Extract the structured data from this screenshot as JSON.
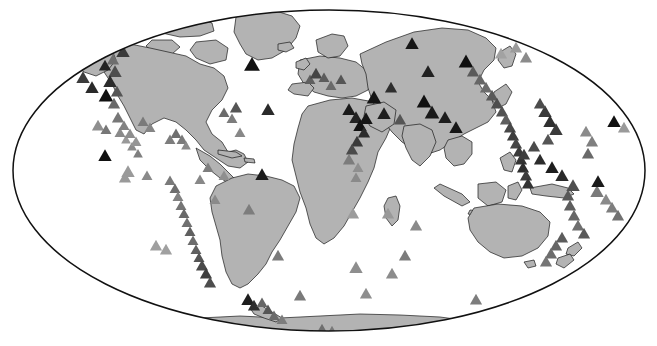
{
  "figure": {
    "title": "",
    "caption": "",
    "width": 657,
    "height": 346,
    "background_color": "#ffffff"
  },
  "chart_data": {
    "type": "scatter",
    "title": "",
    "subtitle": "",
    "xlabel": "",
    "ylabel": "",
    "projection": "mollweide",
    "grid": false,
    "legend": null,
    "annotations": [],
    "xlim": [
      -180,
      180
    ],
    "ylim": [
      -90,
      90
    ],
    "map_style": {
      "land_fill": "#b3b3b3",
      "land_stroke": "#1a1a1a",
      "ocean_fill": "#ffffff",
      "outline_stroke": "#111111",
      "outline_width": 1.4
    },
    "marker": {
      "shape": "triangle",
      "sizes_px": [
        6,
        9,
        12,
        15
      ],
      "shades": [
        "#111111",
        "#4d4d4d",
        "#6e6e6e",
        "#8f8f8f",
        "#aaaaaa"
      ]
    },
    "series": [
      {
        "name": "markers",
        "marker": "triangle",
        "points": [
          {
            "x": 30,
            "y": 24,
            "s": 11,
            "c": "#6e6e6e"
          },
          {
            "x": 44,
            "y": 22,
            "s": 9,
            "c": "#8f8f8f"
          },
          {
            "x": 53,
            "y": 26,
            "s": 9,
            "c": "#6e6e6e"
          },
          {
            "x": 62,
            "y": 23,
            "s": 10,
            "c": "#555555"
          },
          {
            "x": 71,
            "y": 25,
            "s": 9,
            "c": "#7a7a7a"
          },
          {
            "x": 80,
            "y": 27,
            "s": 9,
            "c": "#8f8f8f"
          },
          {
            "x": 88,
            "y": 30,
            "s": 9,
            "c": "#666666"
          },
          {
            "x": 96,
            "y": 34,
            "s": 10,
            "c": "#5a5a5a"
          },
          {
            "x": 104,
            "y": 40,
            "s": 11,
            "c": "#333333"
          },
          {
            "x": 111,
            "y": 46,
            "s": 11,
            "c": "#444444"
          },
          {
            "x": 118,
            "y": 43,
            "s": 12,
            "c": "#1f1f1f"
          },
          {
            "x": 123,
            "y": 52,
            "s": 11,
            "c": "#3a3a3a"
          },
          {
            "x": 113,
            "y": 60,
            "s": 10,
            "c": "#6e6e6e"
          },
          {
            "x": 105,
            "y": 66,
            "s": 10,
            "c": "#222222"
          },
          {
            "x": 115,
            "y": 72,
            "s": 11,
            "c": "#4d4d4d"
          },
          {
            "x": 110,
            "y": 82,
            "s": 11,
            "c": "#2b2b2b"
          },
          {
            "x": 117,
            "y": 92,
            "s": 10,
            "c": "#555555"
          },
          {
            "x": 106,
            "y": 96,
            "s": 12,
            "c": "#111111"
          },
          {
            "x": 114,
            "y": 104,
            "s": 10,
            "c": "#6a6a6a"
          },
          {
            "x": 98,
            "y": 126,
            "s": 10,
            "c": "#8f8f8f"
          },
          {
            "x": 106,
            "y": 130,
            "s": 9,
            "c": "#777777"
          },
          {
            "x": 105,
            "y": 156,
            "s": 11,
            "c": "#111111"
          },
          {
            "x": 128,
            "y": 172,
            "s": 11,
            "c": "#9a9a9a"
          },
          {
            "x": 120,
            "y": 133,
            "s": 9,
            "c": "#8a8a8a"
          },
          {
            "x": 126,
            "y": 140,
            "s": 8,
            "c": "#999999"
          },
          {
            "x": 132,
            "y": 147,
            "s": 8,
            "c": "#8c8c8c"
          },
          {
            "x": 138,
            "y": 154,
            "s": 8,
            "c": "#7f7f7f"
          },
          {
            "x": 143,
            "y": 122,
            "s": 9,
            "c": "#7a7a7a"
          },
          {
            "x": 150,
            "y": 128,
            "s": 9,
            "c": "#858585"
          },
          {
            "x": 176,
            "y": 134,
            "s": 9,
            "c": "#6f6f6f"
          },
          {
            "x": 182,
            "y": 140,
            "s": 9,
            "c": "#7b7b7b"
          },
          {
            "x": 186,
            "y": 146,
            "s": 8,
            "c": "#8b8b8b"
          },
          {
            "x": 170,
            "y": 181,
            "s": 9,
            "c": "#7a7a7a"
          },
          {
            "x": 175,
            "y": 189,
            "s": 9,
            "c": "#6e6e6e"
          },
          {
            "x": 178,
            "y": 197,
            "s": 9,
            "c": "#828282"
          },
          {
            "x": 181,
            "y": 206,
            "s": 9,
            "c": "#757575"
          },
          {
            "x": 184,
            "y": 214,
            "s": 9,
            "c": "#6a6a6a"
          },
          {
            "x": 187,
            "y": 223,
            "s": 9,
            "c": "#707070"
          },
          {
            "x": 190,
            "y": 232,
            "s": 9,
            "c": "#5f5f5f"
          },
          {
            "x": 193,
            "y": 241,
            "s": 9,
            "c": "#6c6c6c"
          },
          {
            "x": 196,
            "y": 250,
            "s": 9,
            "c": "#606060"
          },
          {
            "x": 199,
            "y": 258,
            "s": 9,
            "c": "#555555"
          },
          {
            "x": 202,
            "y": 266,
            "s": 10,
            "c": "#4a4a4a"
          },
          {
            "x": 206,
            "y": 274,
            "s": 10,
            "c": "#3f3f3f"
          },
          {
            "x": 210,
            "y": 283,
            "s": 10,
            "c": "#4d4d4d"
          },
          {
            "x": 166,
            "y": 250,
            "s": 10,
            "c": "#a0a0a0"
          },
          {
            "x": 125,
            "y": 178,
            "s": 10,
            "c": "#9a9a9a"
          },
          {
            "x": 147,
            "y": 176,
            "s": 9,
            "c": "#8a8a8a"
          },
          {
            "x": 170,
            "y": 140,
            "s": 9,
            "c": "#7d7d7d"
          },
          {
            "x": 224,
            "y": 113,
            "s": 9,
            "c": "#6b6b6b"
          },
          {
            "x": 236,
            "y": 108,
            "s": 10,
            "c": "#555555"
          },
          {
            "x": 232,
            "y": 119,
            "s": 9,
            "c": "#7c7c7c"
          },
          {
            "x": 240,
            "y": 133,
            "s": 9,
            "c": "#888888"
          },
          {
            "x": 252,
            "y": 65,
            "s": 13,
            "c": "#111111"
          },
          {
            "x": 268,
            "y": 110,
            "s": 11,
            "c": "#2a2a2a"
          },
          {
            "x": 262,
            "y": 175,
            "s": 11,
            "c": "#1c1c1c"
          },
          {
            "x": 249,
            "y": 210,
            "s": 10,
            "c": "#7d7d7d"
          },
          {
            "x": 278,
            "y": 256,
            "s": 10,
            "c": "#7b7b7b"
          },
          {
            "x": 310,
            "y": 80,
            "s": 9,
            "c": "#5f5f5f"
          },
          {
            "x": 316,
            "y": 74,
            "s": 10,
            "c": "#444444"
          },
          {
            "x": 324,
            "y": 78,
            "s": 9,
            "c": "#5c5c5c"
          },
          {
            "x": 331,
            "y": 86,
            "s": 9,
            "c": "#6a6a6a"
          },
          {
            "x": 341,
            "y": 80,
            "s": 9,
            "c": "#555555"
          },
          {
            "x": 349,
            "y": 110,
            "s": 11,
            "c": "#1a1a1a"
          },
          {
            "x": 356,
            "y": 118,
            "s": 11,
            "c": "#222222"
          },
          {
            "x": 360,
            "y": 126,
            "s": 11,
            "c": "#111111"
          },
          {
            "x": 364,
            "y": 133,
            "s": 10,
            "c": "#2b2b2b"
          },
          {
            "x": 357,
            "y": 142,
            "s": 10,
            "c": "#3a3a3a"
          },
          {
            "x": 352,
            "y": 150,
            "s": 10,
            "c": "#4a4a4a"
          },
          {
            "x": 349,
            "y": 160,
            "s": 10,
            "c": "#7c7c7c"
          },
          {
            "x": 358,
            "y": 168,
            "s": 9,
            "c": "#8f8f8f"
          },
          {
            "x": 356,
            "y": 178,
            "s": 9,
            "c": "#8a8a8a"
          },
          {
            "x": 353,
            "y": 214,
            "s": 10,
            "c": "#9c9c9c"
          },
          {
            "x": 356,
            "y": 268,
            "s": 11,
            "c": "#8e8e8e"
          },
          {
            "x": 366,
            "y": 119,
            "s": 11,
            "c": "#161616"
          },
          {
            "x": 374,
            "y": 98,
            "s": 12,
            "c": "#141414"
          },
          {
            "x": 384,
            "y": 114,
            "s": 11,
            "c": "#1e1e1e"
          },
          {
            "x": 391,
            "y": 88,
            "s": 10,
            "c": "#2e2e2e"
          },
          {
            "x": 400,
            "y": 120,
            "s": 10,
            "c": "#555555"
          },
          {
            "x": 412,
            "y": 44,
            "s": 11,
            "c": "#171717"
          },
          {
            "x": 424,
            "y": 102,
            "s": 12,
            "c": "#111111"
          },
          {
            "x": 432,
            "y": 113,
            "s": 12,
            "c": "#1a1a1a"
          },
          {
            "x": 428,
            "y": 72,
            "s": 11,
            "c": "#222222"
          },
          {
            "x": 445,
            "y": 118,
            "s": 11,
            "c": "#1d1d1d"
          },
          {
            "x": 456,
            "y": 128,
            "s": 11,
            "c": "#161616"
          },
          {
            "x": 466,
            "y": 62,
            "s": 12,
            "c": "#0f0f0f"
          },
          {
            "x": 473,
            "y": 72,
            "s": 10,
            "c": "#5a5a5a"
          },
          {
            "x": 480,
            "y": 80,
            "s": 10,
            "c": "#666666"
          },
          {
            "x": 486,
            "y": 88,
            "s": 10,
            "c": "#6c6c6c"
          },
          {
            "x": 492,
            "y": 96,
            "s": 10,
            "c": "#595959"
          },
          {
            "x": 497,
            "y": 104,
            "s": 10,
            "c": "#4e4e4e"
          },
          {
            "x": 502,
            "y": 112,
            "s": 10,
            "c": "#525252"
          },
          {
            "x": 506,
            "y": 120,
            "s": 10,
            "c": "#5e5e5e"
          },
          {
            "x": 510,
            "y": 128,
            "s": 10,
            "c": "#484848"
          },
          {
            "x": 513,
            "y": 136,
            "s": 10,
            "c": "#3d3d3d"
          },
          {
            "x": 516,
            "y": 144,
            "s": 10,
            "c": "#464646"
          },
          {
            "x": 519,
            "y": 152,
            "s": 10,
            "c": "#3a3a3a"
          },
          {
            "x": 521,
            "y": 160,
            "s": 10,
            "c": "#333333"
          },
          {
            "x": 523,
            "y": 168,
            "s": 10,
            "c": "#2d2d2d"
          },
          {
            "x": 526,
            "y": 176,
            "s": 10,
            "c": "#3c3c3c"
          },
          {
            "x": 528,
            "y": 184,
            "s": 10,
            "c": "#343434"
          },
          {
            "x": 536,
            "y": 40,
            "s": 11,
            "c": "#777777"
          },
          {
            "x": 546,
            "y": 46,
            "s": 11,
            "c": "#8a8a8a"
          },
          {
            "x": 556,
            "y": 52,
            "s": 10,
            "c": "#999999"
          },
          {
            "x": 526,
            "y": 58,
            "s": 10,
            "c": "#8b8b8b"
          },
          {
            "x": 516,
            "y": 48,
            "s": 10,
            "c": "#9b9b9b"
          },
          {
            "x": 501,
            "y": 54,
            "s": 10,
            "c": "#a2a2a2"
          },
          {
            "x": 545,
            "y": 112,
            "s": 11,
            "c": "#3a3a3a"
          },
          {
            "x": 540,
            "y": 104,
            "s": 10,
            "c": "#4c4c4c"
          },
          {
            "x": 550,
            "y": 122,
            "s": 11,
            "c": "#2f2f2f"
          },
          {
            "x": 556,
            "y": 130,
            "s": 11,
            "c": "#3b3b3b"
          },
          {
            "x": 548,
            "y": 140,
            "s": 10,
            "c": "#555555"
          },
          {
            "x": 534,
            "y": 147,
            "s": 10,
            "c": "#4b4b4b"
          },
          {
            "x": 524,
            "y": 155,
            "s": 10,
            "c": "#3e3e3e"
          },
          {
            "x": 540,
            "y": 160,
            "s": 10,
            "c": "#2c2c2c"
          },
          {
            "x": 552,
            "y": 168,
            "s": 11,
            "c": "#1d1d1d"
          },
          {
            "x": 562,
            "y": 176,
            "s": 11,
            "c": "#2a2a2a"
          },
          {
            "x": 573,
            "y": 186,
            "s": 11,
            "c": "#4f4f4f"
          },
          {
            "x": 568,
            "y": 196,
            "s": 10,
            "c": "#585858"
          },
          {
            "x": 570,
            "y": 206,
            "s": 10,
            "c": "#5e5e5e"
          },
          {
            "x": 574,
            "y": 216,
            "s": 10,
            "c": "#676767"
          },
          {
            "x": 578,
            "y": 226,
            "s": 10,
            "c": "#6e6e6e"
          },
          {
            "x": 584,
            "y": 234,
            "s": 10,
            "c": "#5a5a5a"
          },
          {
            "x": 597,
            "y": 192,
            "s": 11,
            "c": "#7a7a7a"
          },
          {
            "x": 606,
            "y": 200,
            "s": 10,
            "c": "#8a8a8a"
          },
          {
            "x": 612,
            "y": 208,
            "s": 10,
            "c": "#7e7e7e"
          },
          {
            "x": 618,
            "y": 216,
            "s": 10,
            "c": "#717171"
          },
          {
            "x": 614,
            "y": 122,
            "s": 11,
            "c": "#111111"
          },
          {
            "x": 624,
            "y": 128,
            "s": 10,
            "c": "#9a9a9a"
          },
          {
            "x": 598,
            "y": 182,
            "s": 11,
            "c": "#1a1a1a"
          },
          {
            "x": 586,
            "y": 132,
            "s": 10,
            "c": "#8b8b8b"
          },
          {
            "x": 592,
            "y": 142,
            "s": 10,
            "c": "#7f7f7f"
          },
          {
            "x": 588,
            "y": 154,
            "s": 10,
            "c": "#6a6a6a"
          },
          {
            "x": 562,
            "y": 238,
            "s": 10,
            "c": "#5c5c5c"
          },
          {
            "x": 556,
            "y": 246,
            "s": 10,
            "c": "#666666"
          },
          {
            "x": 551,
            "y": 254,
            "s": 10,
            "c": "#6d6d6d"
          },
          {
            "x": 546,
            "y": 262,
            "s": 10,
            "c": "#757575"
          },
          {
            "x": 416,
            "y": 226,
            "s": 10,
            "c": "#8a8a8a"
          },
          {
            "x": 405,
            "y": 256,
            "s": 10,
            "c": "#7c7c7c"
          },
          {
            "x": 388,
            "y": 214,
            "s": 10,
            "c": "#999999"
          },
          {
            "x": 392,
            "y": 274,
            "s": 10,
            "c": "#8c8c8c"
          },
          {
            "x": 476,
            "y": 300,
            "s": 10,
            "c": "#7d7d7d"
          },
          {
            "x": 366,
            "y": 294,
            "s": 10,
            "c": "#8e8e8e"
          },
          {
            "x": 300,
            "y": 296,
            "s": 10,
            "c": "#7a7a7a"
          },
          {
            "x": 248,
            "y": 300,
            "s": 11,
            "c": "#1e1e1e"
          },
          {
            "x": 254,
            "y": 306,
            "s": 10,
            "c": "#2e2e2e"
          },
          {
            "x": 262,
            "y": 303,
            "s": 9,
            "c": "#666666"
          },
          {
            "x": 268,
            "y": 310,
            "s": 9,
            "c": "#555555"
          },
          {
            "x": 274,
            "y": 316,
            "s": 9,
            "c": "#6a6a6a"
          },
          {
            "x": 282,
            "y": 320,
            "s": 9,
            "c": "#7c7c7c"
          },
          {
            "x": 322,
            "y": 330,
            "s": 10,
            "c": "#6f6f6f"
          },
          {
            "x": 332,
            "y": 332,
            "s": 10,
            "c": "#797979"
          },
          {
            "x": 156,
            "y": 246,
            "s": 10,
            "c": "#9f9f9f"
          },
          {
            "x": 200,
            "y": 180,
            "s": 9,
            "c": "#888888"
          },
          {
            "x": 208,
            "y": 168,
            "s": 9,
            "c": "#7e7e7e"
          },
          {
            "x": 224,
            "y": 176,
            "s": 9,
            "c": "#8f8f8f"
          },
          {
            "x": 215,
            "y": 200,
            "s": 9,
            "c": "#8a8a8a"
          },
          {
            "x": 92,
            "y": 88,
            "s": 11,
            "c": "#2a2a2a"
          },
          {
            "x": 83,
            "y": 78,
            "s": 11,
            "c": "#3b3b3b"
          },
          {
            "x": 118,
            "y": 118,
            "s": 10,
            "c": "#777777"
          },
          {
            "x": 124,
            "y": 126,
            "s": 9,
            "c": "#828282"
          },
          {
            "x": 130,
            "y": 134,
            "s": 9,
            "c": "#8e8e8e"
          },
          {
            "x": 136,
            "y": 142,
            "s": 9,
            "c": "#969696"
          }
        ]
      }
    ]
  }
}
